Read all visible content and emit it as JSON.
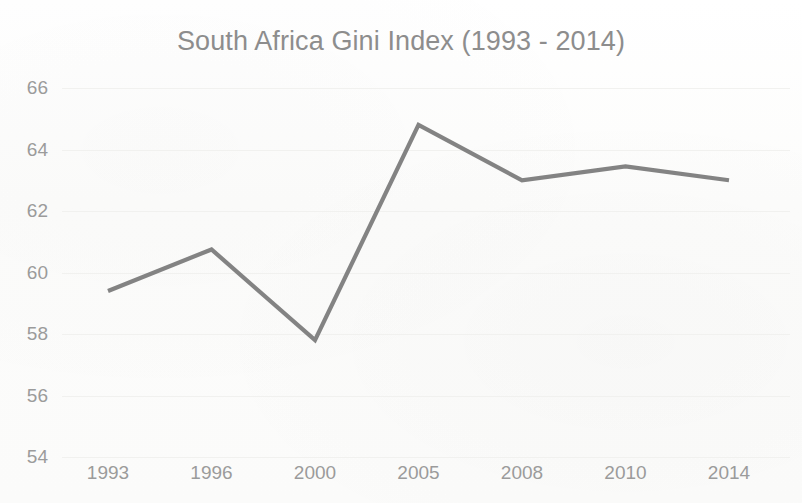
{
  "chart_data": {
    "type": "line",
    "title": "South Africa Gini Index (1993 - 2014)",
    "xlabel": "",
    "ylabel": "",
    "categories": [
      "1993",
      "1996",
      "2000",
      "2005",
      "2008",
      "2010",
      "2014"
    ],
    "values": [
      59.4,
      60.75,
      57.8,
      64.8,
      63.0,
      63.45,
      63.0
    ],
    "series": [
      {
        "name": "Gini Index",
        "values": [
          59.4,
          60.75,
          57.8,
          64.8,
          63.0,
          63.45,
          63.0
        ]
      }
    ],
    "ylim": [
      54,
      66
    ],
    "y_ticks": [
      "54",
      "56",
      "58",
      "60",
      "62",
      "64",
      "66"
    ],
    "y_tick_values": [
      54,
      56,
      58,
      60,
      62,
      64,
      66
    ],
    "grid": true,
    "legend": "none",
    "legend_position": "none",
    "line_color": "#7a7a7a",
    "grid_color": "#f1f1ef",
    "text_color": "#9b9b9b",
    "title_color": "#8d8d8d",
    "background_color": "#fdfdfd"
  }
}
